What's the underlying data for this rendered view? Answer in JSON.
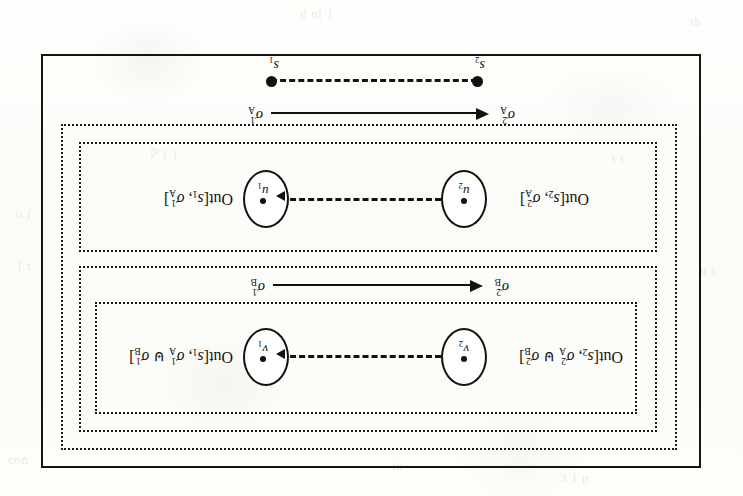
{
  "figure": {
    "caption_note": "",
    "orientation": "rotated-180",
    "frame": {
      "border_color": "#17140f"
    },
    "boxes": [
      {
        "name": "outer-dotted-region",
        "label": ""
      },
      {
        "name": "upper-dotted-region",
        "label": ""
      },
      {
        "name": "upper-inner-dotted-region",
        "label": ""
      },
      {
        "name": "lower-dotted-region",
        "label": ""
      }
    ],
    "upper_row": {
      "left_node": {
        "id": "v2",
        "letter": "v",
        "index": "2"
      },
      "right_node": {
        "id": "v1",
        "letter": "v",
        "index": "1"
      },
      "left_label": {
        "head": "Out",
        "open": "[",
        "store": "s",
        "store_index": "2",
        "sep": ", ",
        "sigma": "σ",
        "sigma_sup": "2",
        "sigma_sub": "A",
        "join": "⊎",
        "sigma2": "σ",
        "sigma2_sup": "2",
        "sigma2_sub": "B",
        "close": "]"
      },
      "right_label": {
        "head": "Out",
        "open": "[",
        "store": "s",
        "store_index": "1",
        "sep": ", ",
        "sigma": "σ",
        "sigma_sup": "1",
        "sigma_sub": "A",
        "join": "⊎",
        "sigma2": "σ",
        "sigma2_sup": "1",
        "sigma2_sub": "B",
        "close": "]"
      },
      "transition": {
        "from_sym": "σ",
        "from_sup": "1",
        "from_sub": "B",
        "to_sym": "σ",
        "to_sup": "2",
        "to_sub": "B"
      }
    },
    "lower_row": {
      "left_node": {
        "id": "u2",
        "letter": "u",
        "index": "2"
      },
      "right_node": {
        "id": "u1",
        "letter": "u",
        "index": "1"
      },
      "left_label": {
        "head": "Out",
        "open": "[",
        "store": "s",
        "store_index": "2",
        "sep": ", ",
        "sigma": "σ",
        "sigma_sup": "2",
        "sigma_sub": "A",
        "close": "]"
      },
      "right_label": {
        "head": "Out",
        "open": "[",
        "store": "s",
        "store_index": "1",
        "sep": ", ",
        "sigma": "σ",
        "sigma_sup": "1",
        "sigma_sub": "A",
        "close": "]"
      },
      "transition": {
        "from_sym": "σ",
        "from_sup": "1",
        "from_sub": "A",
        "to_sym": "σ",
        "to_sup": "2",
        "to_sub": "A"
      }
    },
    "store_line": {
      "left_point": {
        "label": "s",
        "index": "2"
      },
      "right_point": {
        "label": "s",
        "index": "1"
      }
    }
  },
  "page_ghosts": [
    {
      "text": "d σ[ ]",
      "x": 300,
      "y": 6
    },
    {
      "text": "th",
      "x": 690,
      "y": 14
    },
    {
      "text": "ℙ ( )",
      "x": 150,
      "y": 146
    },
    {
      "text": "t c",
      "x": 612,
      "y": 150
    },
    {
      "text": "o f",
      "x": 16,
      "y": 206
    },
    {
      "text": "1 t",
      "x": 16,
      "y": 258
    },
    {
      "text": "u s",
      "x": 700,
      "y": 262
    },
    {
      "text": "con",
      "x": 8,
      "y": 452
    },
    {
      "text": "ta",
      "x": 392,
      "y": 458
    },
    {
      "text": "3 1 p",
      "x": 560,
      "y": 470
    }
  ]
}
